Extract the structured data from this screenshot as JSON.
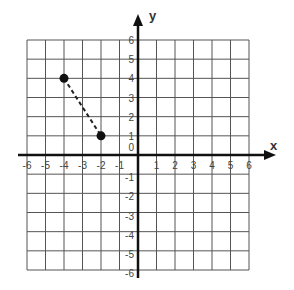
{
  "chart_data": {
    "type": "scatter",
    "title": "",
    "xlabel": "x",
    "ylabel": "y",
    "xlim": [
      -6,
      6
    ],
    "ylim": [
      -6,
      6
    ],
    "grid": true,
    "x_ticks": [
      "-6",
      "-5",
      "-4",
      "-3",
      "-2",
      "-1",
      "1",
      "2",
      "3",
      "4",
      "5",
      "6"
    ],
    "y_ticks": [
      "6",
      "5",
      "4",
      "3",
      "2",
      "1",
      "0",
      "-1",
      "-2",
      "-3",
      "-4",
      "-5",
      "-6"
    ],
    "points": [
      {
        "x": -4,
        "y": 4
      },
      {
        "x": -2,
        "y": 1
      }
    ],
    "segments": [
      {
        "from": {
          "x": -4,
          "y": 4
        },
        "to": {
          "x": -2,
          "y": 1
        },
        "style": "dashed"
      }
    ]
  },
  "colors": {
    "grid": "#555555",
    "axis": "#111111",
    "point": "#111111",
    "tick_text": "#444444"
  }
}
